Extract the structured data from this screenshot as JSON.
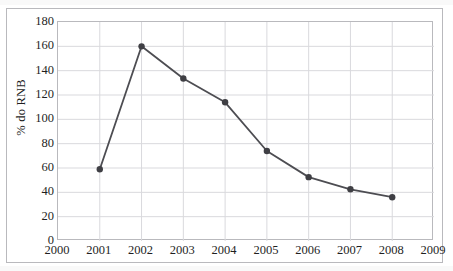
{
  "chart_data": {
    "type": "line",
    "title": "",
    "subtitle": "",
    "xlabel": "",
    "ylabel": "% do RNB",
    "x": [
      2001,
      2002,
      2003,
      2004,
      2005,
      2006,
      2007,
      2008
    ],
    "values": [
      59,
      160,
      133.5,
      114,
      74,
      52.5,
      42.5,
      36
    ],
    "series": [
      {
        "name": "% do RNB",
        "x": [
          2001,
          2002,
          2003,
          2004,
          2005,
          2006,
          2007,
          2008
        ],
        "values": [
          59,
          160,
          133.5,
          114,
          74,
          52.5,
          42.5,
          36
        ]
      }
    ],
    "xlim": [
      2000,
      2009
    ],
    "ylim": [
      0,
      180
    ],
    "x_tick_labels": [
      "2000",
      "2001",
      "2002",
      "2003",
      "2004",
      "2005",
      "2006",
      "2007",
      "2008",
      "2009"
    ],
    "y_tick_labels": [
      "0",
      "20",
      "40",
      "60",
      "80",
      "100",
      "120",
      "140",
      "160",
      "180"
    ],
    "y_ticks": [
      0,
      20,
      40,
      60,
      80,
      100,
      120,
      140,
      160,
      180
    ],
    "x_ticks": [
      2000,
      2001,
      2002,
      2003,
      2004,
      2005,
      2006,
      2007,
      2008,
      2009
    ],
    "grid": {
      "horizontal": true,
      "vertical": true,
      "color": "#d9d9dd"
    },
    "legend": {
      "visible": false,
      "position": "none",
      "entries": []
    },
    "annotations": [],
    "style": {
      "line_color": "#4d4d52",
      "marker_color": "#3f3f44",
      "marker_shape": "circle",
      "line_width": 1.8,
      "marker_size": 3.2,
      "plot_background": "#ffffff",
      "frame_color": "#b9b9bd"
    }
  }
}
